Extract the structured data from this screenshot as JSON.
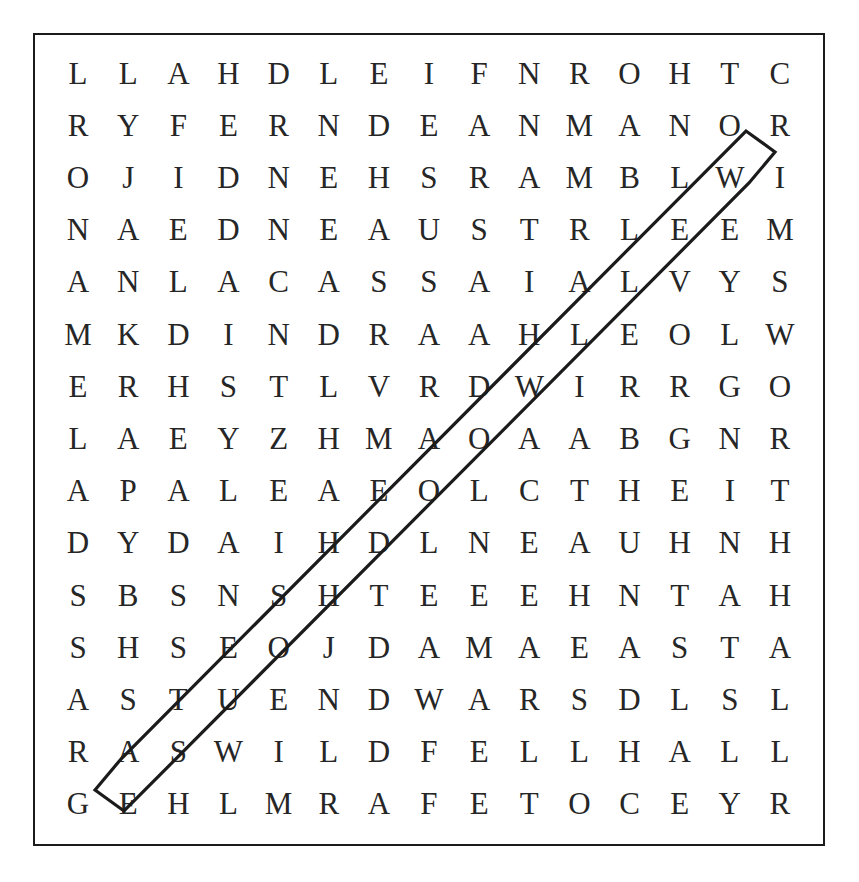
{
  "puzzle": {
    "type": "word-search",
    "rows": 15,
    "columns": 15,
    "border_color": "#1b1b1b",
    "letter_color": "#262626",
    "background_color": "#ffffff",
    "grid": [
      [
        "L",
        "L",
        "A",
        "H",
        "D",
        "L",
        "E",
        "I",
        "F",
        "N",
        "R",
        "O",
        "H",
        "T",
        "C"
      ],
      [
        "R",
        "Y",
        "F",
        "E",
        "R",
        "N",
        "D",
        "E",
        "A",
        "N",
        "M",
        "A",
        "N",
        "O",
        "R"
      ],
      [
        "O",
        "J",
        "I",
        "D",
        "N",
        "E",
        "H",
        "S",
        "R",
        "A",
        "M",
        "B",
        "L",
        "W",
        "I"
      ],
      [
        "N",
        "A",
        "E",
        "D",
        "N",
        "E",
        "A",
        "U",
        "S",
        "T",
        "R",
        "L",
        "E",
        "E",
        "M"
      ],
      [
        "A",
        "N",
        "L",
        "A",
        "C",
        "A",
        "S",
        "S",
        "A",
        "I",
        "A",
        "L",
        "V",
        "Y",
        "S"
      ],
      [
        "M",
        "K",
        "D",
        "I",
        "N",
        "D",
        "R",
        "A",
        "A",
        "H",
        "L",
        "E",
        "O",
        "L",
        "W"
      ],
      [
        "E",
        "R",
        "H",
        "S",
        "T",
        "L",
        "V",
        "R",
        "D",
        "W",
        "I",
        "R",
        "R",
        "G",
        "O"
      ],
      [
        "L",
        "A",
        "E",
        "Y",
        "Z",
        "H",
        "M",
        "A",
        "O",
        "A",
        "A",
        "B",
        "G",
        "N",
        "R"
      ],
      [
        "A",
        "P",
        "A",
        "L",
        "E",
        "A",
        "E",
        "O",
        "L",
        "C",
        "T",
        "H",
        "E",
        "I",
        "T"
      ],
      [
        "D",
        "Y",
        "D",
        "A",
        "I",
        "H",
        "D",
        "L",
        "N",
        "E",
        "A",
        "U",
        "H",
        "N",
        "H"
      ],
      [
        "S",
        "B",
        "S",
        "N",
        "S",
        "H",
        "T",
        "E",
        "E",
        "E",
        "H",
        "N",
        "T",
        "A",
        "H"
      ],
      [
        "S",
        "H",
        "S",
        "E",
        "O",
        "J",
        "D",
        "A",
        "M",
        "A",
        "E",
        "A",
        "S",
        "T",
        "A"
      ],
      [
        "A",
        "S",
        "T",
        "U",
        "E",
        "N",
        "D",
        "W",
        "A",
        "R",
        "S",
        "D",
        "L",
        "S",
        "L"
      ],
      [
        "R",
        "A",
        "S",
        "W",
        "I",
        "L",
        "D",
        "F",
        "E",
        "L",
        "L",
        "H",
        "A",
        "L",
        "L"
      ],
      [
        "G",
        "E",
        "H",
        "L",
        "M",
        "R",
        "A",
        "F",
        "E",
        "T",
        "O",
        "C",
        "E",
        "Y",
        "R"
      ]
    ],
    "found_word_marking": {
      "shape": "elongated-hexagon-outline",
      "direction": "diagonal-up-right",
      "stroke_color": "#1b1b1b",
      "start_cell": {
        "row": 15,
        "column": 2,
        "letter": "E"
      },
      "end_cell": {
        "row": 3,
        "column": 14,
        "letter": "W"
      },
      "letters": [
        "E",
        "S",
        "U",
        "O",
        "H",
        "D",
        "O",
        "O",
        "W",
        "E",
        "E",
        "L",
        "W"
      ]
    }
  }
}
